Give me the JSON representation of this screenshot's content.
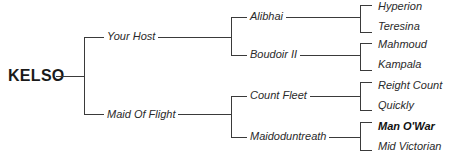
{
  "pedigree": {
    "root": "KELSO",
    "sire": {
      "name": "Your Host",
      "sire": {
        "name": "Alibhai",
        "sire": "Hyperion",
        "dam": "Teresina"
      },
      "dam": {
        "name": "Boudoir II",
        "sire": "Mahmoud",
        "dam": "Kampala"
      }
    },
    "dam": {
      "name": "Maid Of Flight",
      "sire": {
        "name": "Count Fleet",
        "sire": "Reight Count",
        "dam": "Quickly"
      },
      "dam": {
        "name": "Maidoduntreath",
        "sire": "Man O'War",
        "dam": "Mid Victorian"
      }
    }
  },
  "colors": {
    "line": "#3a3a3a",
    "text": "#2a2a2a",
    "background": "#ffffff"
  }
}
